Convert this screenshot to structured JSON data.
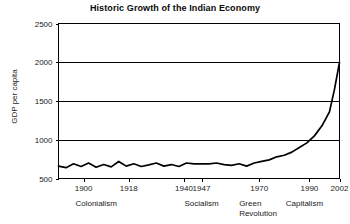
{
  "chart_data": {
    "type": "line",
    "title": "Historic Growth of the Indian Economy",
    "xlabel": "",
    "ylabel": "GDP per capita",
    "grid": "horizontal",
    "legend": "none",
    "xlim": [
      1890,
      2002
    ],
    "ylim": [
      500,
      2500
    ],
    "yticks": [
      500,
      1000,
      1500,
      2000,
      2500
    ],
    "ytick_labels": [
      "500",
      "1000",
      "1500",
      "2000",
      "2500"
    ],
    "xticks": [
      1900,
      1918,
      1940,
      1947,
      1970,
      1990,
      2002
    ],
    "xtick_labels": [
      "1900",
      "1918",
      "1940",
      "1947",
      "1970",
      "1990",
      "2002"
    ],
    "series": [
      {
        "name": "GDP per capita",
        "x": [
          1890,
          1893,
          1896,
          1899,
          1902,
          1905,
          1908,
          1911,
          1914,
          1917,
          1920,
          1923,
          1926,
          1929,
          1932,
          1935,
          1938,
          1941,
          1944,
          1947,
          1950,
          1953,
          1956,
          1959,
          1962,
          1965,
          1968,
          1971,
          1974,
          1977,
          1980,
          1983,
          1986,
          1989,
          1992,
          1995,
          1998,
          2000,
          2002
        ],
        "values": [
          660,
          640,
          690,
          655,
          700,
          645,
          680,
          650,
          720,
          660,
          690,
          655,
          675,
          700,
          660,
          680,
          655,
          700,
          690,
          690,
          690,
          700,
          680,
          670,
          690,
          660,
          700,
          720,
          740,
          780,
          800,
          840,
          900,
          960,
          1050,
          1180,
          1360,
          1650,
          2000
        ]
      }
    ],
    "annotations": [
      {
        "label": "Colonialism",
        "x": 1905
      },
      {
        "label": "Socialism",
        "x": 1947
      },
      {
        "label": "Green",
        "x": 1962
      },
      {
        "label": "Revolution",
        "x": 1962
      },
      {
        "label": "Capitalism",
        "x": 1988
      }
    ]
  },
  "figure": {
    "title": "Historic Growth of the Indian Economy",
    "y_axis_title": "GDP per capita",
    "y_tick_labels": [
      "2500",
      "2000",
      "1500",
      "1000",
      "500"
    ],
    "x_tick_labels": [
      "1900",
      "1918",
      "1940",
      "1947",
      "1970",
      "1990",
      "2002"
    ],
    "era_labels": [
      "Colonialism",
      "Socialism",
      "Green",
      "Revolution",
      "Capitalism"
    ],
    "line_color": "#000000",
    "grid_color": "#000000",
    "background_color": "#ffffff"
  }
}
